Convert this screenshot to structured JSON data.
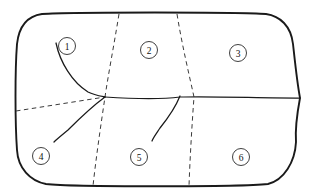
{
  "figure": {
    "type": "region-partition-diagram",
    "background_color": "#ffffff",
    "stroke_color": "#1a1a1a",
    "dashed_stroke_color": "#3a3a3a",
    "width": 316,
    "height": 195
  },
  "outer_boundary": {
    "name": "rounded-region-outline",
    "style": "solid",
    "description": "closed rounded rectangle with a cusp on the right edge"
  },
  "solid_curves": [
    {
      "id": "curve-upper-left",
      "style": "solid",
      "description": "curve from region 1 down to central junction"
    },
    {
      "id": "curve-lower-left",
      "style": "solid",
      "description": "curve from central junction down-left toward region 4"
    },
    {
      "id": "curve-horizontal-separator",
      "style": "solid",
      "description": "horizontal curve from central junction to right-edge cusp"
    },
    {
      "id": "curve-lower-middle",
      "style": "solid",
      "description": "curve hanging below separator into region 5"
    }
  ],
  "dashed_curves": [
    {
      "id": "dashed-left-ray",
      "style": "dashed",
      "description": "dashed segment from left boundary to central junction"
    },
    {
      "id": "dashed-divider-1",
      "style": "dashed",
      "description": "dashed line from top boundary through junction to bottom boundary"
    },
    {
      "id": "dashed-divider-2",
      "style": "dashed",
      "description": "dashed line from top boundary to bottom boundary, right of center"
    }
  ],
  "region_labels": [
    {
      "text": "1",
      "cx": 67,
      "cy": 46,
      "r": 8.5
    },
    {
      "text": "2",
      "cx": 149,
      "cy": 50,
      "r": 8.5
    },
    {
      "text": "3",
      "cx": 238,
      "cy": 53,
      "r": 8.5
    },
    {
      "text": "4",
      "cx": 41,
      "cy": 156,
      "r": 8.5
    },
    {
      "text": "5",
      "cx": 139,
      "cy": 157,
      "r": 8.5
    },
    {
      "text": "6",
      "cx": 241,
      "cy": 157,
      "r": 8.5
    }
  ]
}
